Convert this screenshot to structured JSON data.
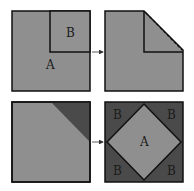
{
  "colors": {
    "light_gray": "#8f8f8f",
    "dark_gray": "#4a4a4a",
    "outline": "#111111",
    "background": "#ffffff"
  },
  "panels": {
    "top_left": {
      "label_a": "A",
      "label_b": "B"
    },
    "top_right": {
      "description": "square with corner B folded along dashed diagonal"
    },
    "bottom_left": {
      "description": "square with dark triangular corner"
    },
    "bottom_right": {
      "label_center": "A",
      "label_corners": [
        "B",
        "B",
        "B",
        "B"
      ]
    }
  },
  "arrows": [
    "top-arrow",
    "bottom-arrow"
  ]
}
